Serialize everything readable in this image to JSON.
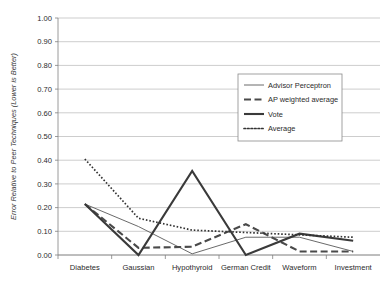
{
  "chart_data": {
    "type": "line",
    "title": "",
    "xlabel": "",
    "ylabel": "Error Relative to Peer Techniques (Lower is Better)",
    "categories": [
      "Diabetes",
      "Gaussian",
      "Hypothyroid",
      "German Credit",
      "Waveform",
      "Investment"
    ],
    "ylim": [
      0.0,
      1.0
    ],
    "yticks": [
      "0.00",
      "0.10",
      "0.20",
      "0.30",
      "0.40",
      "0.50",
      "0.60",
      "0.70",
      "0.80",
      "0.90",
      "1.00"
    ],
    "ytick_values": [
      0.0,
      0.1,
      0.2,
      0.3,
      0.4,
      0.5,
      0.6,
      0.7,
      0.8,
      0.9,
      1.0
    ],
    "grid": true,
    "grid_axis": "y",
    "legend_position": "upper right",
    "series": [
      {
        "name": "Advisor Perceptron",
        "style": "solid-thin",
        "color": "#595959",
        "width": 0.9,
        "values": [
          0.215,
          0.12,
          0.005,
          0.075,
          0.075,
          0.015
        ]
      },
      {
        "name": "AP weighted average",
        "style": "dashed",
        "color": "#4a4a4a",
        "width": 2.1,
        "values": [
          0.215,
          0.03,
          0.035,
          0.13,
          0.015,
          0.015
        ]
      },
      {
        "name": "Vote",
        "style": "solid-thick",
        "color": "#3a3a3a",
        "width": 2.1,
        "values": [
          0.215,
          0.0,
          0.355,
          0.0,
          0.09,
          0.06
        ]
      },
      {
        "name": "Average",
        "style": "dotted",
        "color": "#333333",
        "width": 1.7,
        "values": [
          0.405,
          0.155,
          0.105,
          0.095,
          0.085,
          0.075
        ]
      }
    ]
  },
  "legend": {
    "entries": [
      {
        "label": "Advisor Perceptron"
      },
      {
        "label": "AP weighted average"
      },
      {
        "label": "Vote"
      },
      {
        "label": "Average"
      }
    ]
  }
}
